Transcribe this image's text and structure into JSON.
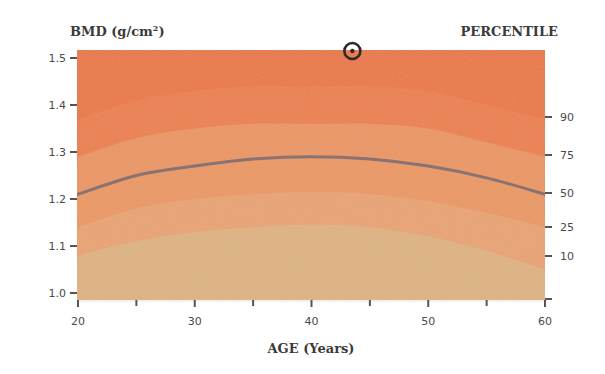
{
  "chart_data": {
    "type": "area",
    "title": "",
    "ylabel": "BMD (g/cm²)",
    "xlabel": "AGE (Years)",
    "right_axis_label": "PERCENTILE",
    "xlim": [
      20,
      60
    ],
    "ylim": [
      0.98,
      1.52
    ],
    "x_ticks": [
      20,
      30,
      40,
      50,
      60
    ],
    "x_minor_ticks": [
      25,
      35,
      45,
      55
    ],
    "y_ticks": [
      1.0,
      1.1,
      1.2,
      1.3,
      1.4,
      1.5
    ],
    "y_tick_labels": [
      "1.0",
      "1.1",
      "1.2",
      "1.3",
      "1.4",
      "1.5"
    ],
    "grid": false,
    "percentile_labels": [
      {
        "label": "90",
        "bmd_at_60": 1.37
      },
      {
        "label": "75",
        "bmd_at_60": 1.29
      },
      {
        "label": "50",
        "bmd_at_60": 1.21
      },
      {
        "label": "25",
        "bmd_at_60": 1.14
      },
      {
        "label": "10",
        "bmd_at_60": 1.08
      }
    ],
    "x": [
      20,
      25,
      30,
      35,
      40,
      45,
      50,
      55,
      60
    ],
    "series": [
      {
        "name": "90th percentile",
        "values": [
          1.37,
          1.41,
          1.43,
          1.44,
          1.44,
          1.44,
          1.43,
          1.4,
          1.37
        ]
      },
      {
        "name": "75th percentile",
        "values": [
          1.29,
          1.33,
          1.35,
          1.36,
          1.36,
          1.36,
          1.35,
          1.32,
          1.29
        ]
      },
      {
        "name": "50th percentile (reference line)",
        "values": [
          1.21,
          1.25,
          1.27,
          1.285,
          1.29,
          1.285,
          1.27,
          1.245,
          1.21
        ]
      },
      {
        "name": "25th percentile",
        "values": [
          1.14,
          1.18,
          1.2,
          1.21,
          1.215,
          1.21,
          1.195,
          1.17,
          1.14
        ]
      },
      {
        "name": "10th percentile",
        "values": [
          1.08,
          1.11,
          1.13,
          1.14,
          1.145,
          1.14,
          1.12,
          1.09,
          1.05
        ]
      }
    ],
    "band_colors": [
      "#e8743f",
      "#e98650",
      "#e8935e",
      "#e6a070",
      "#dcb07e"
    ],
    "reference_line_color": "#8a7270",
    "patient_marker": {
      "age": 43.5,
      "bmd": 1.52,
      "symbol": "circle-dot"
    }
  },
  "labels": {
    "ylabel": "BMD (g/cm²)",
    "ylabel_base": "BMD (g/cm",
    "ylabel_sup": "2",
    "ylabel_close": ")",
    "xlabel": "AGE (Years)",
    "right_label": "PERCENTILE"
  }
}
